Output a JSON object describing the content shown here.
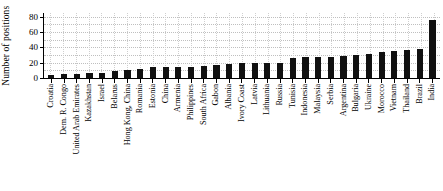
{
  "chart_data": {
    "type": "bar",
    "title": "",
    "xlabel": "",
    "ylabel": "Number of positions",
    "ylim": [
      0,
      85
    ],
    "yticks": [
      0,
      20,
      40,
      60,
      80
    ],
    "grid": "dotted",
    "legend": "none",
    "bar_color": "#111111",
    "categories": [
      "Croatia",
      "Dem. R. Congo",
      "United Arab Emirates",
      "Kazakhstan",
      "Israel",
      "Belarus",
      "Hong Kong, China",
      "Romania",
      "Estonia",
      "China",
      "Armenia",
      "Philippines",
      "South Africa",
      "Gabon",
      "Albania",
      "Ivory Coast",
      "Latvia",
      "Lithuania",
      "Russia",
      "Tunisia",
      "Indonesia",
      "Malaysia",
      "Serbia",
      "Argentina",
      "Bulgaria",
      "Ukraine",
      "Morocco",
      "Vietnam",
      "Thailand",
      "Brazil",
      "India"
    ],
    "values": [
      4,
      5,
      5,
      7,
      7,
      9,
      11,
      12,
      14,
      14,
      15,
      15,
      16,
      17,
      18,
      19,
      19,
      20,
      20,
      26,
      27,
      27,
      28,
      29,
      30,
      32,
      34,
      35,
      36,
      38,
      76
    ]
  }
}
